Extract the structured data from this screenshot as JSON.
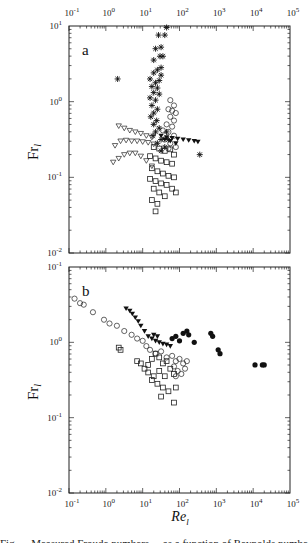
{
  "chart_data": [
    {
      "panel": "a",
      "type": "scatter",
      "title": "",
      "xlabel": "Re_l",
      "ylabel": "Fr_l",
      "xscale": "log",
      "yscale": "log",
      "xlim": [
        0.1,
        100000
      ],
      "ylim": [
        0.01,
        10
      ],
      "x_tick_labels": [
        "10-1",
        "100",
        "101",
        "102",
        "103",
        "104",
        "105"
      ],
      "x_tick_labels_position": "top",
      "y_tick_labels": [
        "101",
        "100",
        "10-1",
        "10-2"
      ],
      "grid": false,
      "legend": null,
      "series_log10": [
        {
          "name": "asterisk",
          "marker": "star",
          "points": [
            [
              1.65,
              0.98
            ],
            [
              1.43,
              0.88
            ],
            [
              1.6,
              0.88
            ],
            [
              1.5,
              0.72
            ],
            [
              1.35,
              0.7
            ],
            [
              1.47,
              0.6
            ],
            [
              1.55,
              0.6
            ],
            [
              1.3,
              0.55
            ],
            [
              1.5,
              0.45
            ],
            [
              1.4,
              0.42
            ],
            [
              1.3,
              0.38
            ],
            [
              1.5,
              0.35
            ],
            [
              1.2,
              0.3
            ],
            [
              1.45,
              0.28
            ],
            [
              1.35,
              0.25
            ],
            [
              1.25,
              0.2
            ],
            [
              1.4,
              0.18
            ],
            [
              1.3,
              0.12
            ],
            [
              1.45,
              0.1
            ],
            [
              1.2,
              0.05
            ],
            [
              1.35,
              0.02
            ],
            [
              1.25,
              -0.05
            ],
            [
              1.4,
              -0.1
            ],
            [
              1.3,
              -0.15
            ],
            [
              1.22,
              -0.2
            ],
            [
              1.38,
              -0.25
            ],
            [
              1.3,
              -0.3
            ],
            [
              1.45,
              -0.35
            ],
            [
              1.35,
              -0.4
            ],
            [
              1.28,
              -0.45
            ],
            [
              1.5,
              -0.5
            ],
            [
              1.4,
              -0.55
            ],
            [
              1.6,
              -0.6
            ],
            [
              1.5,
              -0.65
            ],
            [
              0.32,
              0.3
            ],
            [
              2.55,
              -0.7
            ],
            [
              1.7,
              -0.5
            ],
            [
              1.65,
              -0.4
            ]
          ]
        },
        {
          "name": "open-circle",
          "marker": "circle",
          "points": [
            [
              1.75,
              0.02
            ],
            [
              1.85,
              -0.05
            ],
            [
              1.7,
              -0.1
            ],
            [
              1.8,
              -0.12
            ],
            [
              1.9,
              -0.15
            ],
            [
              1.75,
              -0.2
            ],
            [
              1.85,
              -0.25
            ],
            [
              1.65,
              -0.3
            ],
            [
              1.8,
              -0.33
            ],
            [
              1.7,
              -0.4
            ],
            [
              1.85,
              -0.45
            ],
            [
              1.6,
              -0.5
            ],
            [
              1.75,
              -0.55
            ],
            [
              1.9,
              -0.6
            ],
            [
              1.7,
              -0.62
            ],
            [
              1.55,
              -0.38
            ]
          ]
        },
        {
          "name": "triangle-down",
          "marker": "triangle",
          "points": [
            [
              0.35,
              -0.32
            ],
            [
              0.5,
              -0.35
            ],
            [
              0.65,
              -0.38
            ],
            [
              0.8,
              -0.4
            ],
            [
              0.95,
              -0.42
            ],
            [
              1.1,
              -0.45
            ],
            [
              1.25,
              -0.47
            ],
            [
              0.25,
              -0.58
            ],
            [
              0.4,
              -0.52
            ],
            [
              0.55,
              -0.51
            ],
            [
              0.7,
              -0.52
            ],
            [
              0.85,
              -0.52
            ],
            [
              1.0,
              -0.53
            ],
            [
              1.15,
              -0.54
            ],
            [
              1.3,
              -0.56
            ],
            [
              0.2,
              -0.8
            ],
            [
              0.35,
              -0.75
            ],
            [
              0.5,
              -0.7
            ],
            [
              0.65,
              -0.68
            ],
            [
              0.8,
              -0.68
            ],
            [
              0.95,
              -0.72
            ],
            [
              1.1,
              -0.78
            ],
            [
              1.25,
              -0.85
            ]
          ]
        },
        {
          "name": "filled-triangle",
          "marker": "filled-triangle",
          "points": [
            [
              1.5,
              -0.45
            ],
            [
              1.65,
              -0.47
            ],
            [
              1.8,
              -0.48
            ],
            [
              1.95,
              -0.49
            ],
            [
              2.1,
              -0.5
            ],
            [
              2.25,
              -0.51
            ],
            [
              2.4,
              -0.52
            ],
            [
              2.5,
              -0.53
            ],
            [
              1.6,
              -0.5
            ],
            [
              1.75,
              -0.52
            ],
            [
              1.9,
              -0.55
            ]
          ]
        },
        {
          "name": "open-square",
          "marker": "square",
          "points": [
            [
              1.3,
              -0.6
            ],
            [
              1.45,
              -0.62
            ],
            [
              1.6,
              -0.65
            ],
            [
              1.75,
              -0.63
            ],
            [
              1.85,
              -0.7
            ],
            [
              1.2,
              -0.72
            ],
            [
              1.35,
              -0.75
            ],
            [
              1.5,
              -0.78
            ],
            [
              1.65,
              -0.8
            ],
            [
              1.8,
              -0.82
            ],
            [
              1.25,
              -0.88
            ],
            [
              1.4,
              -0.92
            ],
            [
              1.55,
              -0.95
            ],
            [
              1.7,
              -0.98
            ],
            [
              1.85,
              -1.0
            ],
            [
              1.2,
              -1.02
            ],
            [
              1.35,
              -1.05
            ],
            [
              1.5,
              -1.08
            ],
            [
              1.65,
              -1.1
            ],
            [
              1.3,
              -1.15
            ],
            [
              1.45,
              -1.2
            ],
            [
              1.6,
              -1.25
            ],
            [
              1.25,
              -1.3
            ],
            [
              1.4,
              -1.35
            ],
            [
              1.35,
              -1.45
            ],
            [
              1.8,
              -1.15
            ],
            [
              1.9,
              -1.2
            ]
          ]
        }
      ]
    },
    {
      "panel": "b",
      "type": "scatter",
      "title": "",
      "xlabel": "Re_l",
      "ylabel": "Fr_l",
      "xscale": "log",
      "yscale": "log",
      "xlim": [
        0.1,
        100000
      ],
      "ylim": [
        0.01,
        10
      ],
      "x_tick_labels": [
        "10-1",
        "100",
        "101",
        "102",
        "103",
        "104",
        "105"
      ],
      "x_tick_labels_position": "bottom",
      "y_tick_labels": [
        "10-1",
        "100",
        "10-1",
        "10-2"
      ],
      "grid": false,
      "legend": null,
      "series_log10": [
        {
          "name": "open-circle",
          "marker": "circle",
          "points": [
            [
              -0.85,
              0.58
            ],
            [
              -0.7,
              0.52
            ],
            [
              -0.6,
              0.5
            ],
            [
              -0.35,
              0.4
            ],
            [
              -0.05,
              0.3
            ],
            [
              0.1,
              0.25
            ],
            [
              0.3,
              0.22
            ],
            [
              0.5,
              0.15
            ],
            [
              0.7,
              0.1
            ],
            [
              0.85,
              0.05
            ],
            [
              1.0,
              0.02
            ],
            [
              1.1,
              -0.05
            ],
            [
              1.2,
              -0.1
            ],
            [
              1.35,
              -0.15
            ],
            [
              1.5,
              -0.12
            ],
            [
              1.65,
              -0.2
            ],
            [
              1.8,
              -0.18
            ],
            [
              1.9,
              -0.25
            ],
            [
              2.0,
              -0.22
            ],
            [
              2.1,
              -0.28
            ],
            [
              1.85,
              -0.32
            ],
            [
              1.95,
              -0.38
            ],
            [
              2.05,
              -0.42
            ],
            [
              1.9,
              -0.45
            ],
            [
              2.15,
              -0.35
            ],
            [
              2.2,
              -0.25
            ]
          ]
        },
        {
          "name": "filled-triangle",
          "marker": "filled-triangle",
          "points": [
            [
              0.55,
              0.45
            ],
            [
              0.65,
              0.42
            ],
            [
              0.72,
              0.38
            ],
            [
              0.8,
              0.33
            ],
            [
              0.88,
              0.28
            ],
            [
              0.95,
              0.22
            ],
            [
              1.05,
              0.15
            ],
            [
              1.15,
              0.08
            ],
            [
              1.25,
              0.05
            ],
            [
              1.35,
              0.02
            ],
            [
              1.45,
              0.0
            ],
            [
              1.55,
              -0.02
            ],
            [
              1.65,
              -0.03
            ],
            [
              1.75,
              -0.05
            ],
            [
              1.3,
              0.1
            ],
            [
              1.4,
              0.08
            ]
          ]
        },
        {
          "name": "filled-circle",
          "marker": "filled-circle",
          "points": [
            [
              1.8,
              0.05
            ],
            [
              1.9,
              0.08
            ],
            [
              2.0,
              0.02
            ],
            [
              2.1,
              0.12
            ],
            [
              2.2,
              0.15
            ],
            [
              2.25,
              0.1
            ],
            [
              2.4,
              0.0
            ],
            [
              2.85,
              0.12
            ],
            [
              2.9,
              0.08
            ],
            [
              3.05,
              -0.1
            ],
            [
              3.1,
              -0.15
            ],
            [
              4.05,
              -0.3
            ],
            [
              4.25,
              -0.3
            ],
            [
              4.3,
              -0.3
            ]
          ]
        },
        {
          "name": "open-square",
          "marker": "square",
          "points": [
            [
              0.35,
              -0.07
            ],
            [
              0.4,
              -0.1
            ],
            [
              0.85,
              -0.25
            ],
            [
              0.95,
              -0.28
            ],
            [
              1.05,
              -0.35
            ],
            [
              1.15,
              -0.3
            ],
            [
              1.25,
              -0.22
            ],
            [
              1.35,
              -0.15
            ],
            [
              1.45,
              -0.2
            ],
            [
              1.55,
              -0.28
            ],
            [
              1.65,
              -0.25
            ],
            [
              1.15,
              -0.4
            ],
            [
              1.3,
              -0.45
            ],
            [
              1.45,
              -0.38
            ],
            [
              1.6,
              -0.45
            ],
            [
              1.75,
              -0.35
            ],
            [
              1.85,
              -0.42
            ],
            [
              1.25,
              -0.5
            ],
            [
              1.4,
              -0.55
            ],
            [
              1.55,
              -0.6
            ],
            [
              1.7,
              -0.65
            ],
            [
              1.9,
              -0.6
            ],
            [
              1.5,
              -0.72
            ],
            [
              1.85,
              -0.8
            ]
          ]
        }
      ]
    }
  ],
  "figure": {
    "panel_a_label": "a",
    "panel_b_label": "b",
    "ylabel_main": "Fr",
    "ylabel_sub": "l",
    "xlabel_main": "Re",
    "xlabel_sub": "l",
    "top_x_ticks": [
      {
        "base": "10",
        "exp": "-1"
      },
      {
        "base": "10",
        "exp": "0"
      },
      {
        "base": "10",
        "exp": "1"
      },
      {
        "base": "10",
        "exp": "2"
      },
      {
        "base": "10",
        "exp": "3"
      },
      {
        "base": "10",
        "exp": "4"
      },
      {
        "base": "10",
        "exp": "5"
      }
    ],
    "bottom_x_ticks": [
      {
        "base": "10",
        "exp": "-1"
      },
      {
        "base": "10",
        "exp": "0"
      },
      {
        "base": "10",
        "exp": "1"
      },
      {
        "base": "10",
        "exp": "2"
      },
      {
        "base": "10",
        "exp": "3"
      },
      {
        "base": "10",
        "exp": "4"
      },
      {
        "base": "10",
        "exp": "5"
      }
    ],
    "panel_a_y_ticks": [
      {
        "base": "10",
        "exp": "1"
      },
      {
        "base": "10",
        "exp": "0"
      },
      {
        "base": "10",
        "exp": "-1"
      },
      {
        "base": "10",
        "exp": "-2"
      }
    ],
    "panel_b_y_ticks": [
      {
        "base": "10",
        "exp": "-1"
      },
      {
        "base": "10",
        "exp": "0"
      },
      {
        "base": "10",
        "exp": "-1"
      },
      {
        "base": "10",
        "exp": "-2"
      }
    ],
    "caption_partial": "Fig. ... Measured Froude numbers ... as a function of Reynolds number ..."
  }
}
